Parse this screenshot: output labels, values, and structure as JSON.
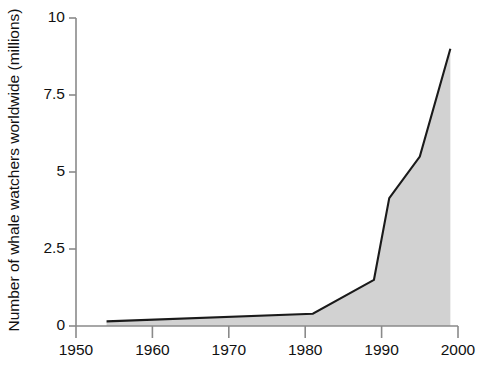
{
  "chart_data": {
    "type": "area",
    "title": "",
    "subtitle": "",
    "xlabel": "",
    "ylabel": "Number of whale watchers worldwide (millions)",
    "xlim": [
      1950,
      2000
    ],
    "ylim": [
      0,
      10
    ],
    "xticks": [
      1950,
      1960,
      1970,
      1980,
      1990,
      2000
    ],
    "xtick_labels": [
      "1950",
      "1960",
      "1970",
      "1980",
      "1990",
      "2000"
    ],
    "yticks": [
      0,
      2.5,
      5,
      7.5,
      10
    ],
    "ytick_labels": [
      "0",
      "2.5",
      "5",
      "7.5",
      "10"
    ],
    "grid": false,
    "legend": null,
    "annotations": [],
    "series": [
      {
        "name": "Whale watchers worldwide",
        "x": [
          1954,
          1981,
          1989,
          1991,
          1995,
          1999
        ],
        "values": [
          0.15,
          0.4,
          1.5,
          4.15,
          5.5,
          9.0
        ],
        "line_color": "#1a1a1a",
        "fill_color": "#d2d2d2"
      }
    ]
  },
  "style": {
    "background": "#ffffff",
    "axis_color": "#8a8a8a",
    "text_color": "#111111",
    "line_color": "#1a1a1a",
    "fill_color": "#d2d2d2"
  }
}
